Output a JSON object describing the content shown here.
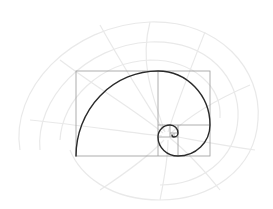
{
  "diagram": {
    "background_color": "#ffffff",
    "shell_color": "#ececec",
    "grid_color": "#9a9a9a",
    "spiral_color": "#2a2a2a",
    "outer_rect": {
      "x": 76,
      "y": 71,
      "w": 134,
      "h": 85
    },
    "squares": [
      {
        "label": "21",
        "x": 76,
        "y": 71,
        "w": 82,
        "h": 85
      },
      {
        "label": "13",
        "x": 158,
        "y": 71,
        "w": 52,
        "h": 54
      },
      {
        "label": "8",
        "x": 178,
        "y": 125,
        "w": 32,
        "h": 31
      },
      {
        "label": "5",
        "x": 158,
        "y": 137,
        "w": 20,
        "h": 19
      },
      {
        "label": "3",
        "x": 158,
        "y": 125,
        "w": 12,
        "h": 12
      },
      {
        "label": "2",
        "x": 170,
        "y": 125,
        "w": 8,
        "h": 8
      },
      {
        "label": "1",
        "x": 170,
        "y": 133,
        "w": 4,
        "h": 4
      }
    ]
  }
}
